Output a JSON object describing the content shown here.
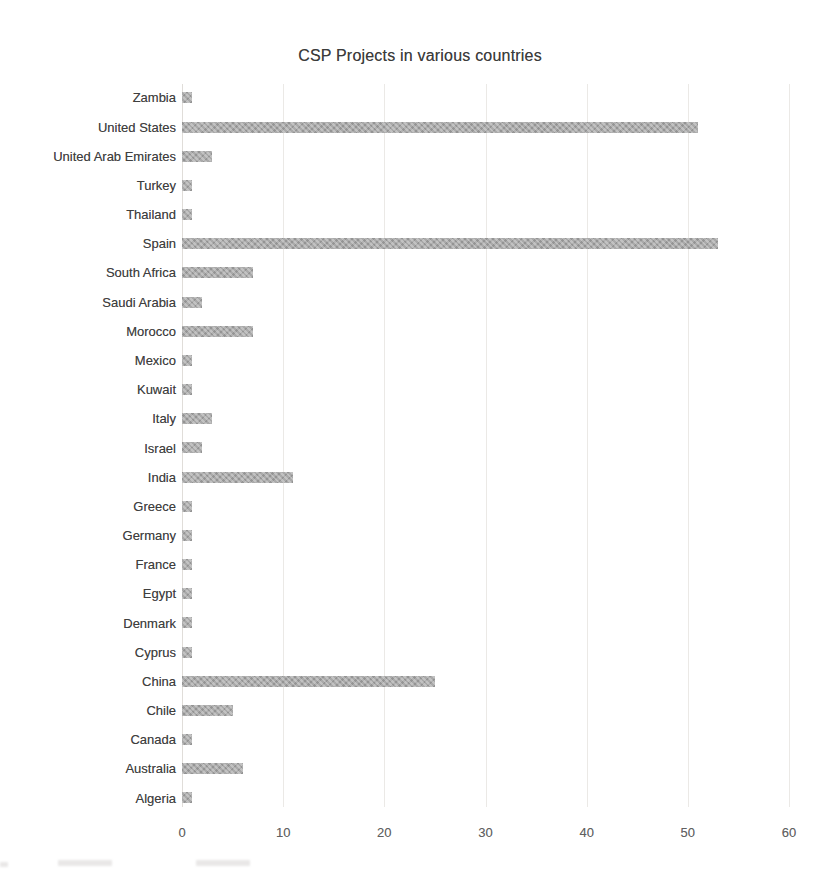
{
  "title": "CSP Projects in various countries",
  "chart_data": {
    "type": "bar",
    "orientation": "horizontal",
    "title": "CSP Projects in various countries",
    "xlabel": "",
    "ylabel": "",
    "categories": [
      "Zambia",
      "United States",
      "United Arab Emirates",
      "Turkey",
      "Thailand",
      "Spain",
      "South Africa",
      "Saudi Arabia",
      "Morocco",
      "Mexico",
      "Kuwait",
      "Italy",
      "Israel",
      "India",
      "Greece",
      "Germany",
      "France",
      "Egypt",
      "Denmark",
      "Cyprus",
      "China",
      "Chile",
      "Canada",
      "Australia",
      "Algeria"
    ],
    "values": [
      1,
      51,
      3,
      1,
      1,
      53,
      7,
      2,
      7,
      1,
      1,
      3,
      2,
      11,
      1,
      1,
      1,
      1,
      1,
      1,
      25,
      5,
      1,
      6,
      1
    ],
    "xlim": [
      0,
      60
    ],
    "xticks": [
      0,
      10,
      20,
      30,
      40,
      50,
      60
    ],
    "grid": true,
    "legend": "none",
    "bar_color": "#aaaaaa",
    "gridline_color": "#ebe9e6",
    "axis_label_color": "#3f3f3f",
    "tick_label_color": "#616161",
    "background_color": "#ffffff"
  }
}
